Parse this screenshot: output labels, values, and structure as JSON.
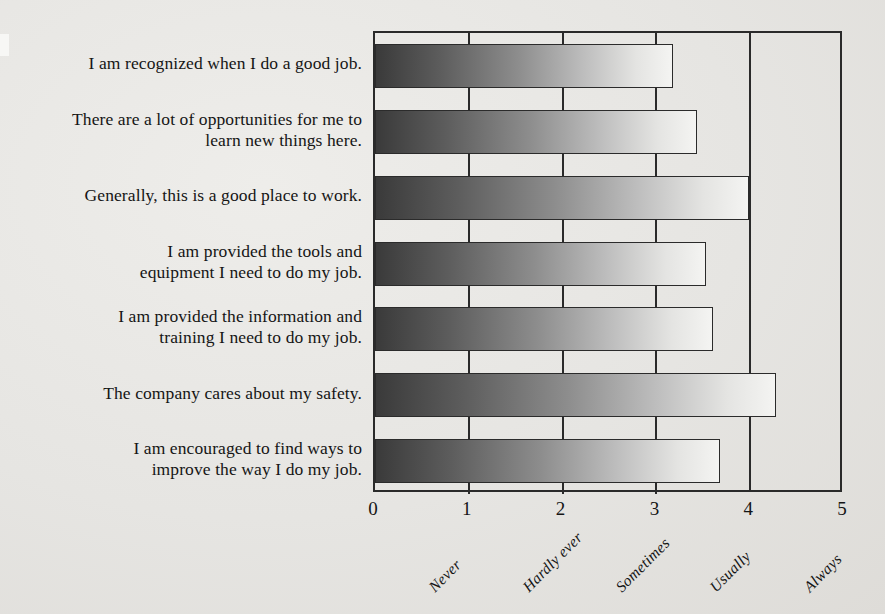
{
  "chart_data": {
    "type": "bar",
    "orientation": "horizontal",
    "title": "",
    "subtitle": "",
    "xlabel": "",
    "ylabel": "",
    "xlim": [
      0,
      5
    ],
    "grid": false,
    "legend": "none",
    "xticks": [
      "0",
      "1",
      "2",
      "3",
      "4",
      "5"
    ],
    "xtick_values": [
      0,
      1,
      2,
      3,
      4,
      5
    ],
    "scale_labels": [
      "Never",
      "Hardly ever",
      "Sometimes",
      "Usually",
      "Always"
    ],
    "scale_label_positions": [
      1,
      2,
      3,
      4,
      5
    ],
    "categories": [
      "I am recognized when I do a good job.",
      "There are a lot of opportunities for me to learn new things here.",
      "Generally, this is a good place to work.",
      "I am provided the tools and equipment I need to do my job.",
      "I am provided the information and training I need to do my job.",
      "The company cares about my safety.",
      "I am encouraged to find ways to improve the way I do my job."
    ],
    "category_lines": [
      [
        "I am recognized when I do a good job."
      ],
      [
        "There are a lot of opportunities for me to",
        "learn new things here."
      ],
      [
        "Generally, this is a good place to work."
      ],
      [
        "I am provided the tools and",
        "equipment I need to do my job."
      ],
      [
        "I am provided the information and",
        "training I need to do my job."
      ],
      [
        "The company cares about my safety."
      ],
      [
        "I am encouraged to find ways to",
        "improve the way I do my job."
      ]
    ],
    "values": [
      3.18,
      3.43,
      3.99,
      3.53,
      3.6,
      4.28,
      3.68
    ]
  },
  "colors": {
    "background": "#e8e8e6",
    "axis": "#2a2a2a",
    "text": "#151515",
    "bar_gradient_start": "#3a3a3a",
    "bar_gradient_end": "#f4f4f2"
  }
}
